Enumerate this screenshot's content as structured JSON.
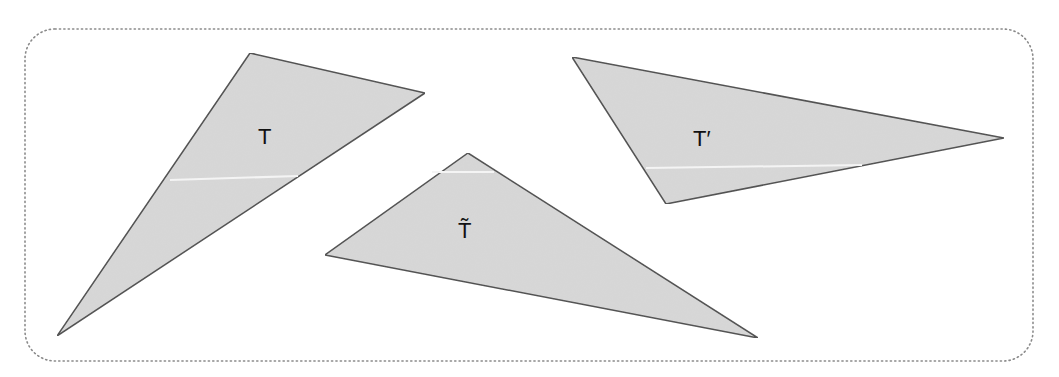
{
  "figure": {
    "frame": {
      "x": 25,
      "y": 29,
      "width": 1008,
      "height": 332,
      "radius": 30,
      "stroke": "#8a8a8a",
      "style": "dotted"
    },
    "colors": {
      "fill": "#d8d8d8",
      "stroke": "#4a4a4a",
      "scanline": "#f4f4f4",
      "label": "#111111"
    },
    "triangles": [
      {
        "id": "T",
        "label": "T",
        "points": "250,53 425,93 57,336",
        "label_x": 258,
        "label_y": 144,
        "scanline": "170,180 298,176"
      },
      {
        "id": "T-tilde",
        "label": "T̃",
        "points": "468,153 325,255 758,338",
        "label_x": 458,
        "label_y": 238,
        "scanline": "432,172 494,172"
      },
      {
        "id": "T-prime",
        "label": "T′",
        "points": "572,57 1004,138 666,204",
        "label_x": 693,
        "label_y": 146,
        "scanline": "646,168 862,165"
      }
    ]
  }
}
